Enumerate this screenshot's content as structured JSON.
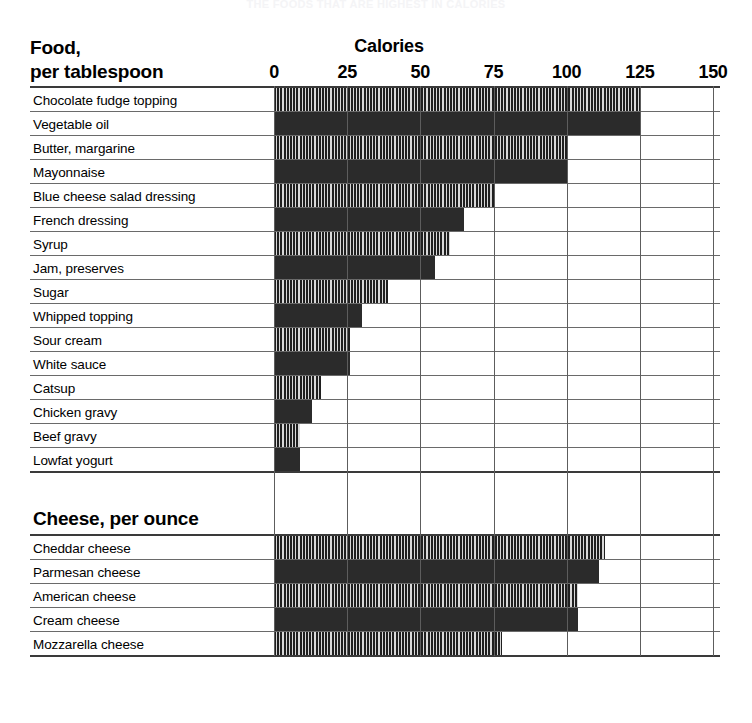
{
  "faint_top_title": "THE FOODS THAT ARE HIGHEST IN CALORIES",
  "header": {
    "row_header_line1": "Food,",
    "row_header_line2": "per tablespoon",
    "axis_title": "Calories"
  },
  "axis": {
    "ticks": [
      0,
      25,
      50,
      75,
      100,
      125,
      150
    ],
    "tick_labels": [
      "0",
      "25",
      "50",
      "75",
      "100",
      "125",
      "150"
    ],
    "min": 0,
    "max": 150
  },
  "sections": [
    {
      "id": "food-per-tablespoon",
      "title": "Food, per tablespoon",
      "unit": "per tablespoon",
      "rows": [
        {
          "label": "Chocolate fudge topping",
          "value": 125,
          "fill": "striped"
        },
        {
          "label": "Vegetable oil",
          "value": 125,
          "fill": "solid"
        },
        {
          "label": "Butter, margarine",
          "value": 100,
          "fill": "striped"
        },
        {
          "label": "Mayonnaise",
          "value": 100,
          "fill": "solid"
        },
        {
          "label": "Blue cheese salad dressing",
          "value": 75,
          "fill": "striped"
        },
        {
          "label": "French dressing",
          "value": 65,
          "fill": "solid"
        },
        {
          "label": "Syrup",
          "value": 60,
          "fill": "striped"
        },
        {
          "label": "Jam, preserves",
          "value": 55,
          "fill": "solid"
        },
        {
          "label": "Sugar",
          "value": 39,
          "fill": "striped"
        },
        {
          "label": "Whipped topping",
          "value": 30,
          "fill": "solid"
        },
        {
          "label": "Sour cream",
          "value": 26,
          "fill": "striped"
        },
        {
          "label": "White sauce",
          "value": 26,
          "fill": "solid"
        },
        {
          "label": "Catsup",
          "value": 16,
          "fill": "striped"
        },
        {
          "label": "Chicken gravy",
          "value": 13,
          "fill": "solid"
        },
        {
          "label": "Beef gravy",
          "value": 9,
          "fill": "striped"
        },
        {
          "label": "Lowfat yogurt",
          "value": 9,
          "fill": "solid"
        }
      ]
    },
    {
      "id": "cheese-per-ounce",
      "title": "Cheese, per ounce",
      "unit": "per ounce",
      "rows": [
        {
          "label": "Cheddar cheese",
          "value": 113,
          "fill": "striped"
        },
        {
          "label": "Parmesan cheese",
          "value": 111,
          "fill": "solid"
        },
        {
          "label": "American cheese",
          "value": 104,
          "fill": "striped"
        },
        {
          "label": "Cream cheese",
          "value": 104,
          "fill": "solid"
        },
        {
          "label": "Mozzarella cheese",
          "value": 78,
          "fill": "striped"
        }
      ]
    }
  ],
  "colors": {
    "bar_dark": "#2b2b2b",
    "stripe_dark": "#1f1f1f",
    "stripe_light": "#d8d8d8",
    "gridline": "#5d5d5d",
    "rule": "#3a3a3a",
    "background": "#ffffff"
  },
  "chart_data": {
    "type": "bar",
    "title": "Calories",
    "subtitle": "",
    "xlabel": "Calories",
    "ylabel": "",
    "orientation": "horizontal",
    "xlim": [
      0,
      150
    ],
    "xticks": [
      0,
      25,
      50,
      75,
      100,
      125,
      150
    ],
    "grid": true,
    "legend": "none",
    "groups": [
      {
        "name": "Food, per tablespoon",
        "categories": [
          "Chocolate fudge topping",
          "Vegetable oil",
          "Butter, margarine",
          "Mayonnaise",
          "Blue cheese salad dressing",
          "French dressing",
          "Syrup",
          "Jam, preserves",
          "Sugar",
          "Whipped topping",
          "Sour cream",
          "White sauce",
          "Catsup",
          "Chicken gravy",
          "Beef gravy",
          "Lowfat yogurt"
        ],
        "values": [
          125,
          125,
          100,
          100,
          75,
          65,
          60,
          55,
          39,
          30,
          26,
          26,
          16,
          13,
          9,
          9
        ]
      },
      {
        "name": "Cheese, per ounce",
        "categories": [
          "Cheddar cheese",
          "Parmesan cheese",
          "American cheese",
          "Cream cheese",
          "Mozzarella cheese"
        ],
        "values": [
          113,
          111,
          104,
          104,
          78
        ]
      }
    ]
  }
}
